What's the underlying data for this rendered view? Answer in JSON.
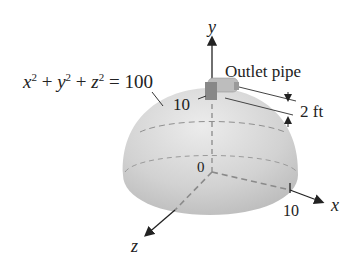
{
  "diagram": {
    "equation": {
      "x": "x",
      "y": "y",
      "z": "z",
      "exp": "2",
      "plus": "+",
      "equals": "=",
      "rhs": "100"
    },
    "labels": {
      "outlet_pipe": "Outlet pipe",
      "pipe_dim": "2 ft",
      "top_tick": "10",
      "origin": "0",
      "x_tick": "10"
    },
    "axes": {
      "x": "x",
      "y": "y",
      "z": "z"
    },
    "colors": {
      "hemisphere": "#c9c9c9",
      "hemisphere_light": "#e6e6e6",
      "pipe": "#b0b0b0",
      "axis": "#222222",
      "dashed": "#8a8a8a"
    }
  }
}
